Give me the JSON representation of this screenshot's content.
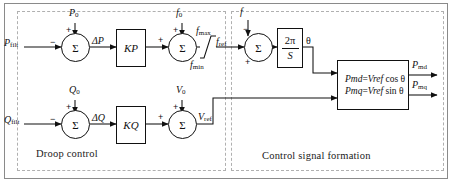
{
  "diagram": {
    "panels": [
      {
        "id": "droop",
        "label": "Droop control"
      },
      {
        "id": "csf",
        "label": "Control signal formation"
      }
    ],
    "sum_symbol": "Σ",
    "signs": {
      "plus": "+",
      "minus": "−"
    },
    "blocks": {
      "kp": {
        "label": "K",
        "sub": "P"
      },
      "kq": {
        "label": "K",
        "sub": "Q"
      },
      "integrator": {
        "numerator": "2π",
        "denominator": "S"
      },
      "output_eq": {
        "line1": "Pₘᵈ = Vᵣₑₓ cos θ",
        "line2": "Pₘₖ = Vᵣₑₓ sin θ",
        "row1_lhs": "P",
        "row1_lhs_sub": "md",
        "row1_rhs_var": "V",
        "row1_rhs_sub": "ref",
        "row1_fn": "cos",
        "row2_lhs": "P",
        "row2_lhs_sub": "mq",
        "row2_rhs_var": "V",
        "row2_rhs_sub": "ref",
        "row2_fn": "sin",
        "theta": "θ",
        "equals": "="
      },
      "saturation": {
        "upper": "f",
        "upper_sub": "max",
        "lower": "f",
        "lower_sub": "min"
      }
    },
    "signals": {
      "p_filt": {
        "base": "P",
        "sub": "filt"
      },
      "p_zero": {
        "base": "P",
        "sub": "0"
      },
      "delta_p": {
        "base": "ΔP"
      },
      "f_zero": {
        "base": "f",
        "sub": "0"
      },
      "f_max": {
        "base": "f",
        "sub": "max"
      },
      "f_min": {
        "base": "f",
        "sub": "min"
      },
      "f_ref": {
        "base": "f",
        "sub": "ref"
      },
      "f_meas": {
        "base": "f"
      },
      "theta": {
        "base": "θ"
      },
      "q_filt": {
        "base": "Q",
        "sub": "filt"
      },
      "q_zero": {
        "base": "Q",
        "sub": "0"
      },
      "delta_q": {
        "base": "ΔQ"
      },
      "v_zero": {
        "base": "V",
        "sub": "0"
      },
      "v_ref": {
        "base": "V",
        "sub": "ref"
      },
      "p_md": {
        "base": "P",
        "sub": "md"
      },
      "p_mq": {
        "base": "P",
        "sub": "mq"
      }
    },
    "colors": {
      "line": "#111111",
      "panel_border": "#b0b0b0",
      "frame_border": "#8a8a8a",
      "background": "#ffffff"
    }
  }
}
